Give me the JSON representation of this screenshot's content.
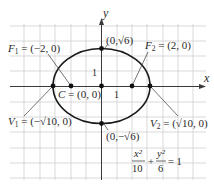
{
  "diagram": {
    "type": "ellipse-graph",
    "equation": {
      "x_numerator": "x²",
      "x_denominator": "10",
      "plus": "+",
      "y_numerator": "y²",
      "y_denominator": "6",
      "equals": "= 1"
    },
    "axes": {
      "x_label": "x",
      "y_label": "y",
      "x_unit_tick": "1",
      "y_unit_tick": "1"
    },
    "labels": {
      "f1_name": "F",
      "f1_sub": "1",
      "f1_value": " = (−2, 0)",
      "f2_name": "F",
      "f2_sub": "2",
      "f2_value": " = (2, 0)",
      "center_name": "C",
      "center_value": " = (0, 0)",
      "v1_name": "V",
      "v1_sub": "1",
      "v1_value": " = (−√10, 0)",
      "v2_name": "V",
      "v2_sub": "2",
      "v2_value": " = (√10, 0)",
      "top_point": "(0,√6)",
      "bottom_point": "(0,−√6)"
    },
    "points": [
      {
        "name": "F1",
        "x": -2,
        "y": 0
      },
      {
        "name": "F2",
        "x": 2,
        "y": 0
      },
      {
        "name": "C",
        "x": 0,
        "y": 0
      },
      {
        "name": "V1",
        "x": -3.162,
        "y": 0
      },
      {
        "name": "V2",
        "x": 3.162,
        "y": 0
      },
      {
        "name": "top",
        "x": 0,
        "y": 2.449
      },
      {
        "name": "bottom",
        "x": 0,
        "y": -2.449
      }
    ],
    "colors": {
      "grid": "#c8c8c8",
      "axes": "#3a3a3a",
      "curve": "#1a1a1a",
      "text": "#2a2a2a"
    }
  }
}
